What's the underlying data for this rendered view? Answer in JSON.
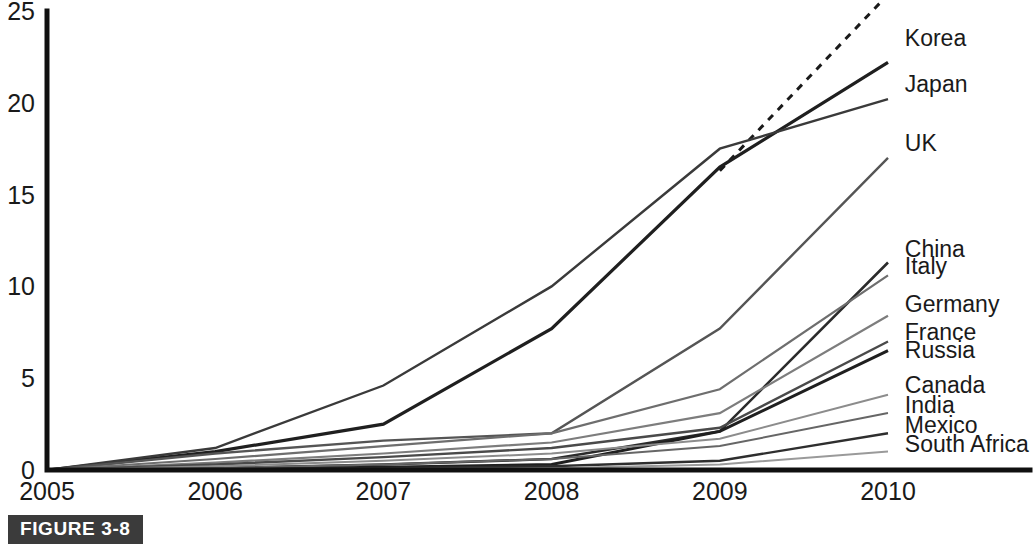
{
  "figure": {
    "caption": "FIGURE 3-8"
  },
  "chart_data": {
    "type": "line",
    "title": "",
    "xlabel": "",
    "ylabel": "",
    "x": [
      2005,
      2006,
      2007,
      2008,
      2009,
      2010
    ],
    "xtick_labels": [
      "2005",
      "2006",
      "2007",
      "2008",
      "2009",
      "2010"
    ],
    "ytick_labels": [
      "0",
      "5",
      "10",
      "15",
      "20",
      "25"
    ],
    "yticks": [
      0,
      5,
      10,
      15,
      20,
      25
    ],
    "ylim": [
      0,
      25
    ],
    "xlim": [
      2005,
      2010
    ],
    "grid": false,
    "legend_position": "right-inline-labels",
    "series": [
      {
        "name": "USA",
        "label": "USA",
        "style": "dashed",
        "color": "#1a1a1a",
        "width": 3,
        "x": [
          2009,
          2010
        ],
        "values": [
          16.3,
          25.9
        ],
        "label_x": 2009.18,
        "label_y": 26.3,
        "partial": true
      },
      {
        "name": "Korea",
        "label": "Korea",
        "style": "solid",
        "color": "#1f1f1f",
        "width": 3.2,
        "x": [
          2005,
          2006,
          2007,
          2008,
          2009,
          2010
        ],
        "values": [
          0,
          1.0,
          2.5,
          7.7,
          16.5,
          22.2
        ],
        "label_x": 2010.1,
        "label_y": 23.1
      },
      {
        "name": "Japan",
        "label": "Japan",
        "style": "solid",
        "color": "#3a3a3a",
        "width": 2.4,
        "x": [
          2005,
          2006,
          2007,
          2008,
          2009,
          2010
        ],
        "values": [
          0,
          1.2,
          4.6,
          10.0,
          17.5,
          20.2
        ],
        "label_x": 2010.1,
        "label_y": 20.6
      },
      {
        "name": "UK",
        "label": "UK",
        "style": "solid",
        "color": "#555555",
        "width": 2.4,
        "x": [
          2005,
          2006,
          2007,
          2008,
          2009,
          2010
        ],
        "values": [
          0,
          0.9,
          1.6,
          2.0,
          7.7,
          17.0
        ],
        "label_x": 2010.1,
        "label_y": 17.4
      },
      {
        "name": "China",
        "label": "China",
        "style": "solid",
        "color": "#2b2b2b",
        "width": 2.6,
        "x": [
          2005,
          2006,
          2007,
          2008,
          2009,
          2010
        ],
        "values": [
          0,
          0.1,
          0.3,
          0.6,
          2.1,
          11.3
        ],
        "label_x": 2010.1,
        "label_y": 11.6
      },
      {
        "name": "Italy",
        "label": "Italy",
        "style": "solid",
        "color": "#6e6e6e",
        "width": 2.2,
        "x": [
          2005,
          2006,
          2007,
          2008,
          2009,
          2010
        ],
        "values": [
          0,
          0.6,
          1.3,
          2.0,
          4.4,
          10.6
        ],
        "label_x": 2010.1,
        "label_y": 10.7
      },
      {
        "name": "Germany",
        "label": "Germany",
        "style": "solid",
        "color": "#7d7d7d",
        "width": 2.2,
        "x": [
          2005,
          2006,
          2007,
          2008,
          2009,
          2010
        ],
        "values": [
          0,
          0.4,
          0.9,
          1.5,
          3.1,
          8.4
        ],
        "label_x": 2010.1,
        "label_y": 8.6
      },
      {
        "name": "France",
        "label": "France",
        "style": "solid",
        "color": "#4a4a4a",
        "width": 2.4,
        "x": [
          2005,
          2006,
          2007,
          2008,
          2009,
          2010
        ],
        "values": [
          0,
          0.3,
          0.7,
          1.2,
          2.3,
          7.0
        ],
        "label_x": 2010.1,
        "label_y": 7.1
      },
      {
        "name": "Russia",
        "label": "Russia",
        "style": "solid",
        "color": "#1f1f1f",
        "width": 3.0,
        "x": [
          2005,
          2006,
          2007,
          2008,
          2009,
          2010
        ],
        "values": [
          0,
          0.05,
          0.15,
          0.3,
          2.1,
          6.5
        ],
        "label_x": 2010.1,
        "label_y": 6.1
      },
      {
        "name": "Canada",
        "label": "Canada",
        "style": "solid",
        "color": "#8c8c8c",
        "width": 2.0,
        "x": [
          2005,
          2006,
          2007,
          2008,
          2009,
          2010
        ],
        "values": [
          0,
          0.2,
          0.5,
          0.9,
          1.7,
          4.1
        ],
        "label_x": 2010.1,
        "label_y": 4.2
      },
      {
        "name": "India",
        "label": "India",
        "style": "solid",
        "color": "#666666",
        "width": 2.0,
        "x": [
          2005,
          2006,
          2007,
          2008,
          2009,
          2010
        ],
        "values": [
          0,
          0.1,
          0.3,
          0.6,
          1.3,
          3.1
        ],
        "label_x": 2010.1,
        "label_y": 3.1
      },
      {
        "name": "Mexico",
        "label": "Mexico",
        "style": "solid",
        "color": "#2e2e2e",
        "width": 2.4,
        "x": [
          2005,
          2006,
          2007,
          2008,
          2009,
          2010
        ],
        "values": [
          0,
          0.05,
          0.1,
          0.2,
          0.5,
          2.0
        ],
        "label_x": 2010.1,
        "label_y": 2.0
      },
      {
        "name": "South Africa",
        "label": "South Africa",
        "style": "solid",
        "color": "#9a9a9a",
        "width": 2.0,
        "x": [
          2005,
          2006,
          2007,
          2008,
          2009,
          2010
        ],
        "values": [
          0,
          0.02,
          0.05,
          0.1,
          0.3,
          1.0
        ],
        "label_x": 2010.1,
        "label_y": 1.0
      }
    ]
  }
}
